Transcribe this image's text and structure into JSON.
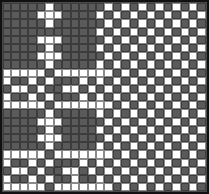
{
  "pattern": {
    "name": "weave-draft-grid",
    "columns": 24,
    "rows": 23,
    "colors": {
      "on": "#ffffff",
      "off": "#5a5a5a",
      "border": "#111111",
      "gridline": "#3c3c3c"
    },
    "cells": [
      "000001000000101010101010",
      "000011100001010101010101",
      "000001000000101010101010",
      "000000000001010101010101",
      "000011100000101010101010",
      "000001000001010101010101",
      "000011100000101010101010",
      "000001000001010101010101",
      "111110111111101010101010",
      "100101000101010101010101",
      "011010011010101010101010",
      "100101000101010101010101",
      "111110111111101010101010",
      "000001000001010101010101",
      "000011100000101010101010",
      "000001000001010101010101",
      "000011100000101010101010",
      "000001000001010101010101",
      "111110111111101010101010",
      "100101000101010101010101",
      "011010011010101010101010",
      "100101001001010101010101",
      "111110111111101010101010"
    ]
  }
}
